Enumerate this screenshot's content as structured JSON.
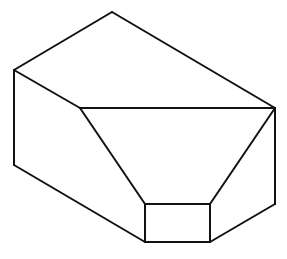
{
  "diagram": {
    "type": "isometric-solid",
    "stroke_color": "#111111",
    "background": "#ffffff",
    "vertices": {
      "top": [
        112,
        12
      ],
      "left_top": [
        14,
        70
      ],
      "left_bottom": [
        14,
        165
      ],
      "inner_left": [
        80,
        108
      ],
      "right_top": [
        275,
        108
      ],
      "right_bottom": [
        275,
        204
      ],
      "box_tl": [
        145,
        204
      ],
      "box_tr": [
        210,
        204
      ],
      "box_br": [
        210,
        242
      ],
      "box_bl": [
        145,
        242
      ]
    },
    "edges": [
      [
        "top",
        "left_top"
      ],
      [
        "top",
        "right_top"
      ],
      [
        "left_top",
        "inner_left"
      ],
      [
        "left_top",
        "left_bottom"
      ],
      [
        "inner_left",
        "right_top"
      ],
      [
        "inner_left",
        "box_tl"
      ],
      [
        "right_top",
        "box_tr"
      ],
      [
        "right_top",
        "right_bottom"
      ],
      [
        "left_bottom",
        "box_bl"
      ],
      [
        "box_tl",
        "box_tr"
      ],
      [
        "box_tr",
        "box_br"
      ],
      [
        "box_br",
        "box_bl"
      ],
      [
        "box_bl",
        "box_tl"
      ],
      [
        "box_br",
        "right_bottom"
      ]
    ]
  }
}
